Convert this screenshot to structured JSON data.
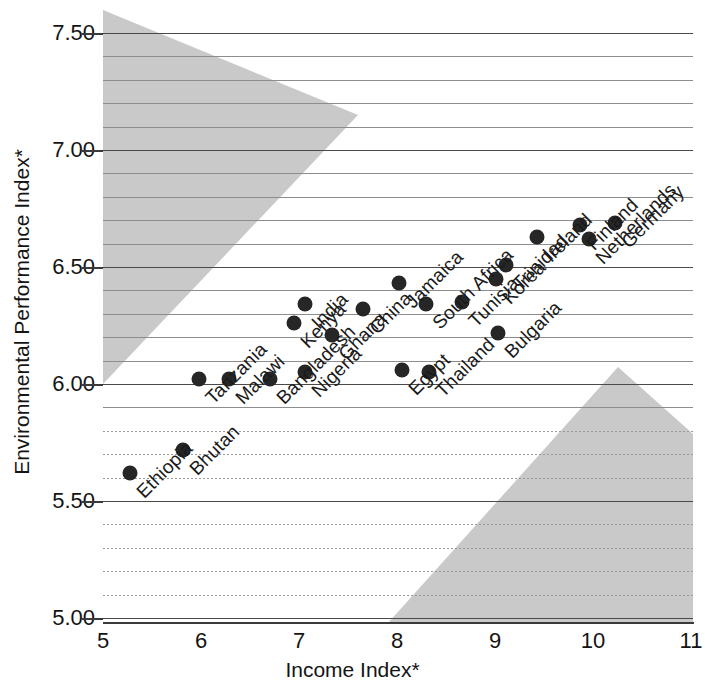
{
  "chart_data": {
    "type": "scatter",
    "title": "",
    "xlabel": "Income Index*",
    "ylabel": "Environmental Performance Index*",
    "xlim": [
      5,
      11
    ],
    "ylim": [
      5.0,
      7.5
    ],
    "xticks": [
      "5",
      "6",
      "7",
      "8",
      "9",
      "10",
      "11"
    ],
    "yticks": [
      "5.00",
      "5.50",
      "6.00",
      "6.50",
      "7.00",
      "7.50"
    ],
    "grid": "horizontal gridlines every 0.1, heavier every 0.5",
    "legend": "none",
    "annotations": [
      "Upper-left shaded triangular region",
      "Lower-right shaded triangular region"
    ],
    "point_color": "#262626",
    "shade_color": "#c9c9c9",
    "points": [
      {
        "label": "Ethiopia",
        "x": 5.28,
        "y": 5.62
      },
      {
        "label": "Bhutan",
        "x": 5.82,
        "y": 5.72
      },
      {
        "label": "Tanzania",
        "x": 5.98,
        "y": 6.02
      },
      {
        "label": "Malawi",
        "x": 6.29,
        "y": 6.02
      },
      {
        "label": "Bangladesh",
        "x": 6.7,
        "y": 6.02
      },
      {
        "label": "Kenya",
        "x": 6.95,
        "y": 6.26
      },
      {
        "label": "Nigeria",
        "x": 7.06,
        "y": 6.05
      },
      {
        "label": "India",
        "x": 7.06,
        "y": 6.34
      },
      {
        "label": "Ghana",
        "x": 7.34,
        "y": 6.21
      },
      {
        "label": "China",
        "x": 7.65,
        "y": 6.32
      },
      {
        "label": "Jamaica",
        "x": 8.02,
        "y": 6.43
      },
      {
        "label": "Egypt",
        "x": 8.05,
        "y": 6.06
      },
      {
        "label": "South Africa",
        "x": 8.3,
        "y": 6.34
      },
      {
        "label": "Thailand",
        "x": 8.33,
        "y": 6.05
      },
      {
        "label": "Tunisia",
        "x": 8.66,
        "y": 6.35
      },
      {
        "label": "Korea",
        "x": 9.01,
        "y": 6.45
      },
      {
        "label": "Bulgaria",
        "x": 9.03,
        "y": 6.22
      },
      {
        "label": "Trinidad",
        "x": 9.11,
        "y": 6.51
      },
      {
        "label": "Ireland",
        "x": 9.43,
        "y": 6.63
      },
      {
        "label": "Netherlands",
        "x": 9.96,
        "y": 6.62
      },
      {
        "label": "Finland",
        "x": 9.87,
        "y": 6.68
      },
      {
        "label": "Germany",
        "x": 10.22,
        "y": 6.69
      }
    ]
  },
  "axes": {
    "x_title": "Income Index*",
    "y_title": "Environmental Performance Index*",
    "x_ticks": [
      "5",
      "6",
      "7",
      "8",
      "9",
      "10",
      "11"
    ],
    "y_ticks": [
      "5.00",
      "5.50",
      "6.00",
      "6.50",
      "7.00",
      "7.50"
    ]
  }
}
